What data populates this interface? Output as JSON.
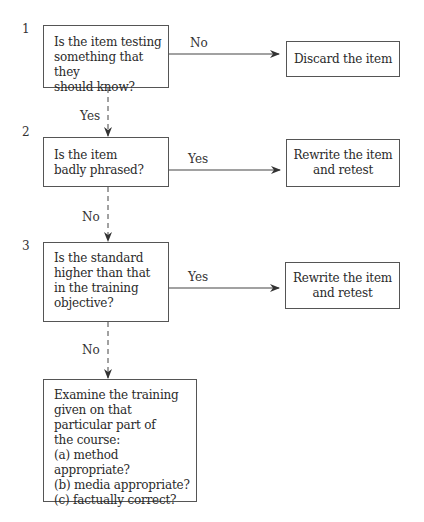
{
  "diagram": {
    "steps": [
      {
        "number": "1",
        "question": "Is the item testing\nsomething that they\nshould know?",
        "branch_label": "No",
        "branch_target": "Discard the item",
        "continue_label": "Yes"
      },
      {
        "number": "2",
        "question": "Is the item\nbadly phrased?",
        "branch_label": "Yes",
        "branch_target": "Rewrite the item\nand retest",
        "continue_label": "No"
      },
      {
        "number": "3",
        "question": "Is the standard\nhigher than that\nin the training\nobjective?",
        "branch_label": "Yes",
        "branch_target": "Rewrite the item\nand retest",
        "continue_label": "No"
      }
    ],
    "final": {
      "text": "Examine the training\ngiven on that\nparticular part of\nthe course:\n(a)  method appropriate?\n(b)  media appropriate?\n(c)  factually correct?"
    },
    "colors": {
      "line": "#444444",
      "box_border": "#555555",
      "text": "#2a2a2a",
      "background": "#ffffff"
    }
  }
}
